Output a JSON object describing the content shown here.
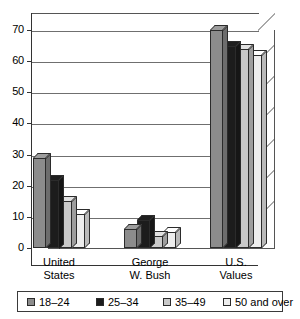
{
  "chart_data": {
    "type": "bar",
    "title": "",
    "xlabel": "",
    "ylabel": "",
    "ylim": [
      0,
      70
    ],
    "yticks": [
      0,
      10,
      20,
      30,
      40,
      50,
      60,
      70
    ],
    "grid": true,
    "legend_position": "bottom",
    "style": "3d-grouped-bar-grayscale",
    "categories": [
      "United States",
      "George W. Bush",
      "U.S. Values"
    ],
    "category_lines": [
      [
        "United",
        "States"
      ],
      [
        "George",
        "W. Bush"
      ],
      [
        "U.S.",
        "Values"
      ]
    ],
    "series": [
      {
        "name": "18–24",
        "color": "#8c8c8c",
        "values": [
          29,
          6,
          70
        ]
      },
      {
        "name": "25–34",
        "color": "#1c1c1c",
        "values": [
          22,
          9,
          65
        ]
      },
      {
        "name": "35–49",
        "color": "#c9c9c9",
        "values": [
          15,
          4,
          64
        ]
      },
      {
        "name": "50 and over",
        "color": "#ededed",
        "values": [
          11,
          5,
          62
        ]
      }
    ]
  },
  "axis": {
    "y_tick_labels": [
      "70",
      "60",
      "50",
      "40",
      "30",
      "20",
      "10",
      "0"
    ]
  },
  "legend": {
    "items": [
      {
        "label": "18–24",
        "color": "#8c8c8c"
      },
      {
        "label": "25–34",
        "color": "#1c1c1c"
      },
      {
        "label": "35–49",
        "color": "#c9c9c9"
      },
      {
        "label": "50 and over",
        "color": "#ededed"
      }
    ]
  },
  "colors": {
    "axis": "#333333",
    "gridline": "#6f6f6f",
    "bar_outline": "#2b2b2b",
    "background": "#ffffff"
  }
}
